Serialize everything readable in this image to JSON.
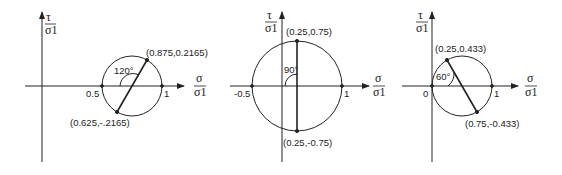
{
  "diagram": {
    "panels": [
      {
        "id": "panel-1",
        "y_axis_label_num": "τ",
        "y_axis_label_den": "σ1",
        "x_axis_label_num": "σ",
        "x_axis_label_den": "σ1",
        "tick_labels": [
          "0.5",
          "1"
        ],
        "angle_label": "120°",
        "points": [
          {
            "label": "(0.875,0.2165)",
            "sigma": 0.875,
            "tau": 0.2165
          },
          {
            "label": "(0.625,-.2165)",
            "sigma": 0.625,
            "tau": -0.2165
          }
        ],
        "circle": {
          "center": 0.75,
          "radius": 0.25
        }
      },
      {
        "id": "panel-2",
        "y_axis_label_num": "τ",
        "y_axis_label_den": "σ1",
        "x_axis_label_num": "σ",
        "x_axis_label_den": "σ1",
        "tick_labels": [
          "-0.5",
          "1"
        ],
        "angle_label": "90°",
        "points": [
          {
            "label": "(0.25,0.75)",
            "sigma": 0.25,
            "tau": 0.75
          },
          {
            "label": "(0.25,-0.75)",
            "sigma": 0.25,
            "tau": -0.75
          }
        ],
        "circle": {
          "center": 0.25,
          "radius": 0.75
        }
      },
      {
        "id": "panel-3",
        "y_axis_label_num": "τ",
        "y_axis_label_den": "σ1",
        "x_axis_label_num": "σ",
        "x_axis_label_den": "σ1",
        "tick_labels": [
          "0",
          "1"
        ],
        "angle_label": "60°",
        "points": [
          {
            "label": "(0.25,0.433)",
            "sigma": 0.25,
            "tau": 0.433
          },
          {
            "label": "(0.75,-0.433)",
            "sigma": 0.75,
            "tau": -0.433
          }
        ],
        "circle": {
          "center": 0.5,
          "radius": 0.5
        }
      }
    ]
  }
}
